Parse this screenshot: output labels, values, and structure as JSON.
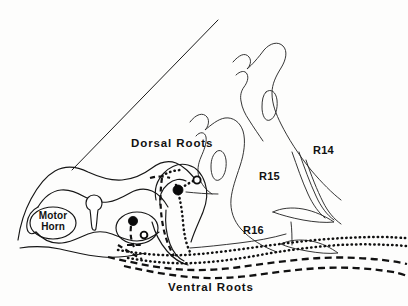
{
  "figure": {
    "kind": "anatomical-line-diagram",
    "background_color": "#fdfdfc",
    "ink_color": "#161616",
    "width": 408,
    "height": 306
  },
  "labels": {
    "dorsal_roots": "Dorsal Roots",
    "ventral_roots": "Ventral Roots",
    "motor_horn_line1": "Motor",
    "motor_horn_line2": "Horn",
    "r14": "R14",
    "r15": "R15",
    "r16": "R16"
  },
  "structures": {
    "central_canal": "central-canal",
    "motor_horn_ellipse": "motor-horn-ellipse",
    "lower_neuron_ellipse": "lower-neuron-ellipse",
    "pointer_line": "dorsal-roots-pointer-line"
  },
  "neurons": [
    {
      "id": "upper-pair",
      "filled_soma": {
        "cx": 178,
        "cy": 190,
        "r": 5.0
      },
      "open_soma": {
        "cx": 197,
        "cy": 180,
        "r": 3.6
      }
    },
    {
      "id": "lower-pair",
      "filled_soma": {
        "cx": 133,
        "cy": 221,
        "r": 4.6
      },
      "open_soma": {
        "cx": 144,
        "cy": 235,
        "r": 3.4
      }
    }
  ],
  "tracts": [
    {
      "id": "dorsal-afferent-dotted",
      "style": "dotted",
      "label_ref": "dorsal_roots"
    },
    {
      "id": "ventral-efferent-dashed",
      "style": "dashed",
      "label_ref": "ventral_roots"
    }
  ],
  "root_lobes": [
    {
      "id": "lobe-r14",
      "label_ref": "r14"
    },
    {
      "id": "lobe-r15",
      "label_ref": "r15"
    },
    {
      "id": "lobe-r16",
      "label_ref": "r16"
    }
  ]
}
